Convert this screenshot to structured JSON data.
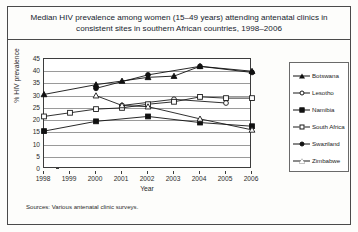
{
  "figure": {
    "title": "Median HIV prevalence among women (15–49 years) attending antenatal clinics in consistent sites in southern African countries, 1998–2006",
    "source_note": "Sources: Various antenatal clinic surveys."
  },
  "chart_data": {
    "type": "line",
    "title": "Median HIV prevalence among women (15–49 years) attending antenatal clinics in consistent sites in southern African countries, 1998–2006",
    "xlabel": "Year",
    "ylabel": "% HIV prevalence",
    "x": [
      1998,
      1999,
      2000,
      2001,
      2002,
      2003,
      2004,
      2005,
      2006
    ],
    "xtick_labels": [
      "1998",
      "1999",
      "2000",
      "2001",
      "2002",
      "2003",
      "2004",
      "2005",
      "2006"
    ],
    "ytick_labels": [
      "0",
      "5",
      "10",
      "15",
      "20",
      "25",
      "30",
      "35",
      "40",
      "45"
    ],
    "yticks": [
      0,
      5,
      10,
      15,
      20,
      25,
      30,
      35,
      40,
      45
    ],
    "ylim": [
      0,
      45
    ],
    "xlim": [
      1998,
      2006
    ],
    "grid": "horizontal",
    "legend_position": "right",
    "series": [
      {
        "name": "Botswana",
        "marker": "triangle-filled",
        "line": "solid",
        "color": "#111111",
        "points": [
          {
            "x": 1998,
            "y": 30.5
          },
          {
            "x": 2000,
            "y": 34.5
          },
          {
            "x": 2001,
            "y": 36.0
          },
          {
            "x": 2002,
            "y": 37.5
          },
          {
            "x": 2003,
            "y": 38.0
          },
          {
            "x": 2004,
            "y": 42.0
          },
          {
            "x": 2006,
            "y": 40.0
          }
        ]
      },
      {
        "name": "Lesotho",
        "marker": "circle-open",
        "line": "solid",
        "color": "#1a1a1a",
        "points": [
          {
            "x": 2001,
            "y": 26.0
          },
          {
            "x": 2003,
            "y": 28.5
          },
          {
            "x": 2005,
            "y": 27.0
          }
        ]
      },
      {
        "name": "Namibia",
        "marker": "square-filled",
        "line": "solid",
        "color": "#111111",
        "points": [
          {
            "x": 1998,
            "y": 15.5
          },
          {
            "x": 2000,
            "y": 19.5
          },
          {
            "x": 2002,
            "y": 21.5
          },
          {
            "x": 2004,
            "y": 19.0
          },
          {
            "x": 2006,
            "y": 17.5
          }
        ]
      },
      {
        "name": "South Africa",
        "marker": "square-open",
        "line": "solid",
        "color": "#1a1a1a",
        "points": [
          {
            "x": 1998,
            "y": 21.5
          },
          {
            "x": 1999,
            "y": 23.0
          },
          {
            "x": 2000,
            "y": 24.5
          },
          {
            "x": 2001,
            "y": 25.0
          },
          {
            "x": 2002,
            "y": 26.5
          },
          {
            "x": 2003,
            "y": 27.5
          },
          {
            "x": 2004,
            "y": 29.5
          },
          {
            "x": 2005,
            "y": 29.0
          },
          {
            "x": 2006,
            "y": 29.0
          }
        ]
      },
      {
        "name": "Swaziland",
        "marker": "circle-filled",
        "line": "solid",
        "color": "#111111",
        "points": [
          {
            "x": 2000,
            "y": 33.0
          },
          {
            "x": 2002,
            "y": 38.5
          },
          {
            "x": 2004,
            "y": 42.0
          },
          {
            "x": 2006,
            "y": 39.5
          }
        ]
      },
      {
        "name": "Zimbabwe",
        "marker": "triangle-open",
        "line": "solid",
        "color": "#1a1a1a",
        "points": [
          {
            "x": 2000,
            "y": 30.0
          },
          {
            "x": 2001,
            "y": 26.0
          },
          {
            "x": 2002,
            "y": 25.5
          },
          {
            "x": 2004,
            "y": 20.5
          },
          {
            "x": 2006,
            "y": 16.0
          }
        ]
      }
    ]
  }
}
